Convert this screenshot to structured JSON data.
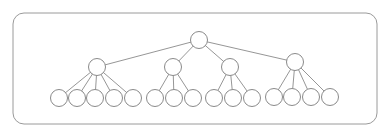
{
  "diagram": {
    "type": "tree",
    "colors": {
      "stroke": "#8a8a8a",
      "frame": "#9a9a9a",
      "fill": "#ffffff",
      "background": "#ffffff"
    },
    "frame": {
      "x": 13,
      "y": 13,
      "width": 364,
      "height": 111,
      "radius": 11
    },
    "node_radius": {
      "root": 8.5,
      "level1": 8.5,
      "leaf": 8.5
    },
    "root": {
      "id": "root",
      "x": 199,
      "y": 40
    },
    "children": [
      {
        "id": "n1",
        "x": 97,
        "y": 67,
        "leaves": [
          {
            "id": "n1-1",
            "x": 59,
            "y": 98
          },
          {
            "id": "n1-2",
            "x": 77,
            "y": 98
          },
          {
            "id": "n1-3",
            "x": 95,
            "y": 98
          },
          {
            "id": "n1-4",
            "x": 114,
            "y": 98
          },
          {
            "id": "n1-5",
            "x": 133,
            "y": 98
          }
        ]
      },
      {
        "id": "n2",
        "x": 173,
        "y": 67,
        "leaves": [
          {
            "id": "n2-1",
            "x": 155,
            "y": 98
          },
          {
            "id": "n2-2",
            "x": 174,
            "y": 98
          },
          {
            "id": "n2-3",
            "x": 193,
            "y": 98
          }
        ]
      },
      {
        "id": "n3",
        "x": 230,
        "y": 67,
        "leaves": [
          {
            "id": "n3-1",
            "x": 214,
            "y": 98
          },
          {
            "id": "n3-2",
            "x": 233,
            "y": 98
          },
          {
            "id": "n3-3",
            "x": 252,
            "y": 98
          }
        ]
      },
      {
        "id": "n4",
        "x": 295,
        "y": 62,
        "leaves": [
          {
            "id": "n4-1",
            "x": 274,
            "y": 97
          },
          {
            "id": "n4-2",
            "x": 292,
            "y": 97
          },
          {
            "id": "n4-3",
            "x": 311,
            "y": 97
          },
          {
            "id": "n4-4",
            "x": 330,
            "y": 97
          }
        ]
      }
    ]
  }
}
